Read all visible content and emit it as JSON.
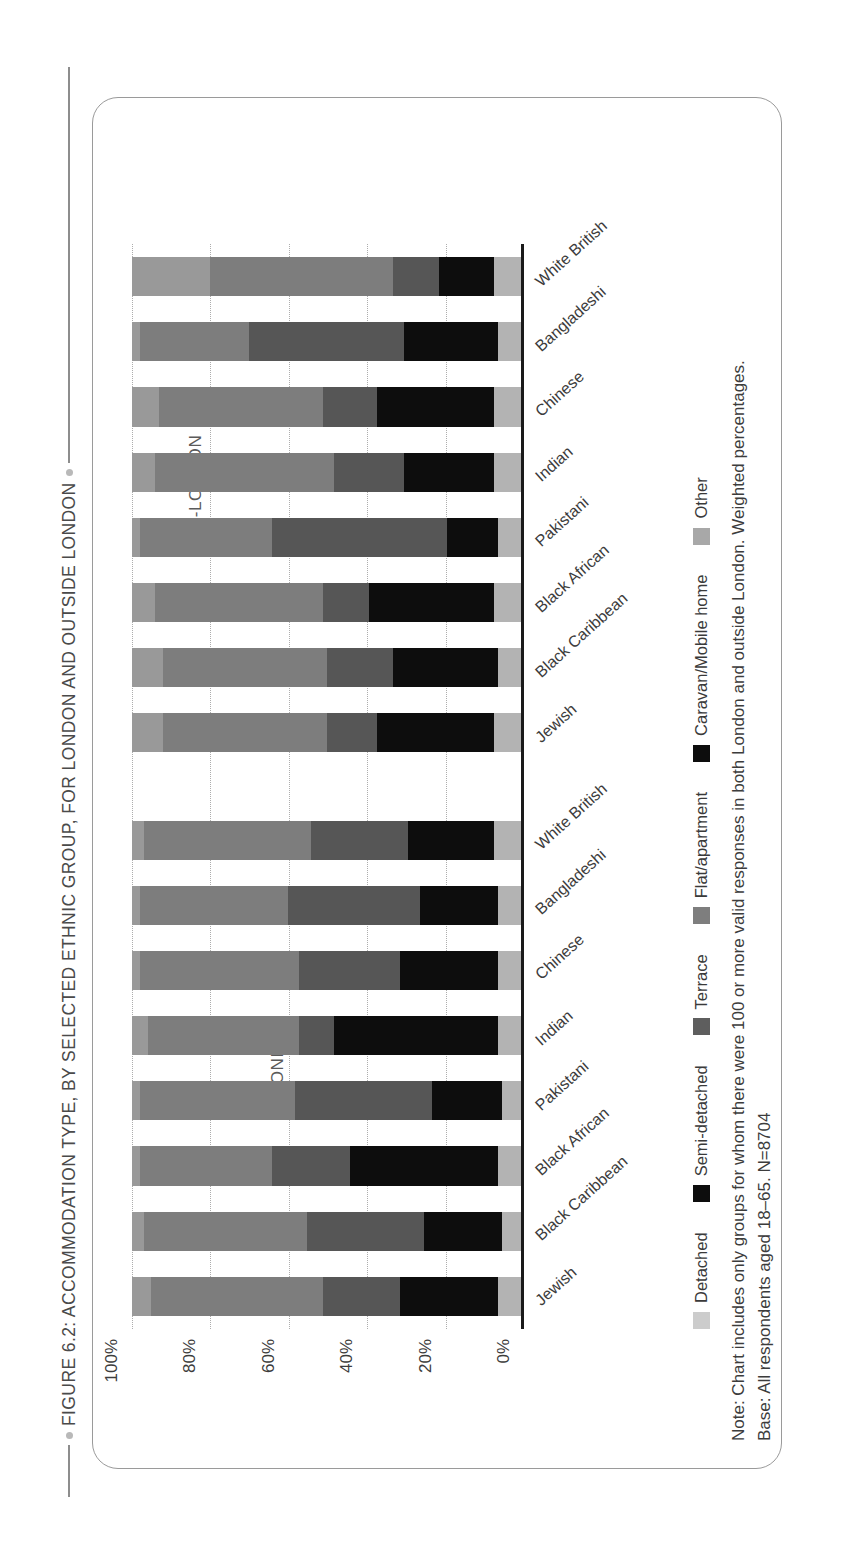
{
  "figure": {
    "title": "FIGURE 6.2: ACCOMMODATION TYPE, BY  SELECTED ETHNIC GROUP, FOR LONDON AND OUTSIDE LONDON",
    "note_line1": "Note: Chart includes only groups for whom there were 100 or more valid responses in both London and outside London. Weighted percentages.",
    "note_line2": "Base: All respondents aged 18–65. N=8704"
  },
  "chart_data": {
    "type": "bar",
    "subtype": "stacked-column-100",
    "title": "FIGURE 6.2: ACCOMMODATION TYPE, BY  SELECTED ETHNIC GROUP, FOR LONDON AND OUTSIDE LONDON",
    "xlabel": "",
    "ylabel": "",
    "ylim": [
      0,
      100
    ],
    "yticks": [
      0,
      20,
      40,
      60,
      80,
      100
    ],
    "ytick_labels": [
      "0%",
      "20%",
      "40%",
      "60%",
      "80%",
      "100%"
    ],
    "grid": "dotted-vertical",
    "legend_position": "bottom-left",
    "groups": [
      {
        "name": "LONDON",
        "categories": [
          "Jewish",
          "Black Caribbean",
          "Black African",
          "Pakistani",
          "Indian",
          "Chinese",
          "Bangladeshi",
          "White British"
        ]
      },
      {
        "name": "NON-LONDON",
        "categories": [
          "Jewish",
          "Black Caribbean",
          "Black African",
          "Pakistani",
          "Indian",
          "Chinese",
          "Bangladeshi",
          "White British"
        ]
      }
    ],
    "series": [
      {
        "name": "Other",
        "color": "#b3b3b3",
        "london": [
          6,
          5,
          6,
          5,
          6,
          6,
          6,
          7
        ],
        "non_london": [
          7,
          6,
          7,
          6,
          7,
          7,
          6,
          7
        ]
      },
      {
        "name": "Caravan/Mobile home",
        "color": "#000000",
        "london": [
          0,
          0,
          0,
          0,
          0,
          0,
          0,
          0
        ],
        "non_london": [
          0,
          0,
          0,
          0,
          0,
          0,
          0,
          0
        ]
      },
      {
        "name": "Flat/apartment",
        "color": "#0d0d0d",
        "london": [
          25,
          20,
          38,
          18,
          42,
          25,
          20,
          22
        ],
        "non_london": [
          30,
          27,
          32,
          13,
          23,
          30,
          24,
          14
        ]
      },
      {
        "name": "Terrace",
        "color": "#565656",
        "london": [
          20,
          30,
          20,
          35,
          9,
          26,
          34,
          25
        ],
        "non_london": [
          13,
          17,
          12,
          45,
          18,
          14,
          40,
          12
        ]
      },
      {
        "name": "Semi-detached",
        "color": "#7d7d7d",
        "london": [
          44,
          42,
          34,
          40,
          39,
          41,
          38,
          43
        ],
        "non_london": [
          42,
          42,
          43,
          34,
          46,
          42,
          28,
          47
        ]
      },
      {
        "name": "Detached",
        "color": "#999999",
        "london": [
          5,
          3,
          2,
          2,
          4,
          2,
          2,
          3
        ],
        "non_london": [
          8,
          8,
          6,
          2,
          6,
          7,
          2,
          20
        ]
      }
    ]
  },
  "legend": {
    "items": [
      {
        "label": "Detached",
        "color": "#cccccc"
      },
      {
        "label": "Semi-detached",
        "color": "#0d0d0d"
      },
      {
        "label": "Terrace",
        "color": "#5e5e5e"
      },
      {
        "label": "Flat/apartment",
        "color": "#7e7e7e"
      },
      {
        "label": "Caravan/Mobile home",
        "color": "#0d0d0d"
      },
      {
        "label": "Other",
        "color": "#a8a8a8"
      }
    ]
  }
}
